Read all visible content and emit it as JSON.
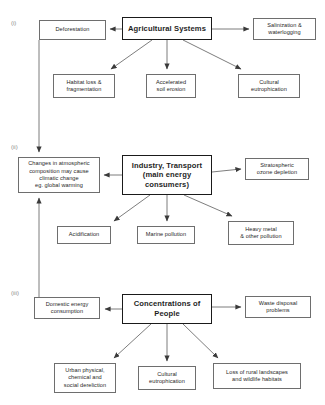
{
  "diagram": {
    "type": "flowchart",
    "line_color": "#6e6e6e",
    "hub_border_color": "#1a1a1a",
    "background": "#ffffff"
  },
  "section_labels": {
    "one": "(i)",
    "two": "(ii)",
    "three": "(iii)"
  },
  "sections": [
    {
      "id": "i",
      "label": "(i)",
      "hub": "Agricultural Systems",
      "left_box": "Deforestation",
      "right_box": "Salinization & waterlogging",
      "bottom_boxes": [
        "Habitat loss & fragmentation",
        "Accelerated soil erosion",
        "Cultural eutrophication"
      ]
    },
    {
      "id": "ii",
      "label": "(ii)",
      "hub": "Industry, Transport (main energy consumers)",
      "left_box": "Changes in atmospheric composition may cause climatic change eg. global warming",
      "right_box": "Stratospheric ozone depletion",
      "bottom_boxes": [
        "Acidification",
        "Marine pollution",
        "Heavy metal & other pollution"
      ]
    },
    {
      "id": "iii",
      "label": "(iii)",
      "hub": "Concentrations of People",
      "left_box": "Domestic energy consumption",
      "right_box": "Waste disposal problems",
      "bottom_boxes": [
        "Urban physical, chemical and social dereliction",
        "Cultural eutrophication",
        "Loss of rural landscapes and wildlife habitats"
      ]
    }
  ],
  "nodes": {
    "deforestation": "Deforestation",
    "agricultural_systems": "Agricultural Systems",
    "salinization": "Salinization &\nwaterlogging",
    "habitat_loss": "Habitat loss &\nfragmentation",
    "soil_erosion": "Accelerated\nsoil erosion",
    "cultural_eutrophication_i": "Cultural\neutrophication",
    "atmospheric_change": "Changes in atmospheric\ncomposition may cause\nclimatic change\neg. global warming",
    "industry_transport": "Industry, Transport\n(main energy\nconsumers)",
    "ozone_depletion": "Stratospheric\nozone depletion",
    "acidification": "Acidification",
    "marine_pollution": "Marine pollution",
    "heavy_metal": "Heavy metal\n& other pollution",
    "domestic_energy": "Domestic energy\nconsumption",
    "concentrations_people": "Concentrations of\nPeople",
    "waste_disposal": "Waste disposal\nproblems",
    "urban_dereliction": "Urban physical,\nchemical and\nsocial dereliction",
    "cultural_eutrophication_iii": "Cultural\neutrophication",
    "rural_loss": "Loss of rural landscapes\nand wildlife habitats"
  },
  "cross_links": [
    {
      "from": "Deforestation",
      "to": "Changes in atmospheric composition may cause climatic change eg. global warming",
      "direction": "down"
    },
    {
      "from": "Domestic energy consumption",
      "to": "Changes in atmospheric composition may cause climatic change eg. global warming",
      "direction": "up"
    }
  ]
}
